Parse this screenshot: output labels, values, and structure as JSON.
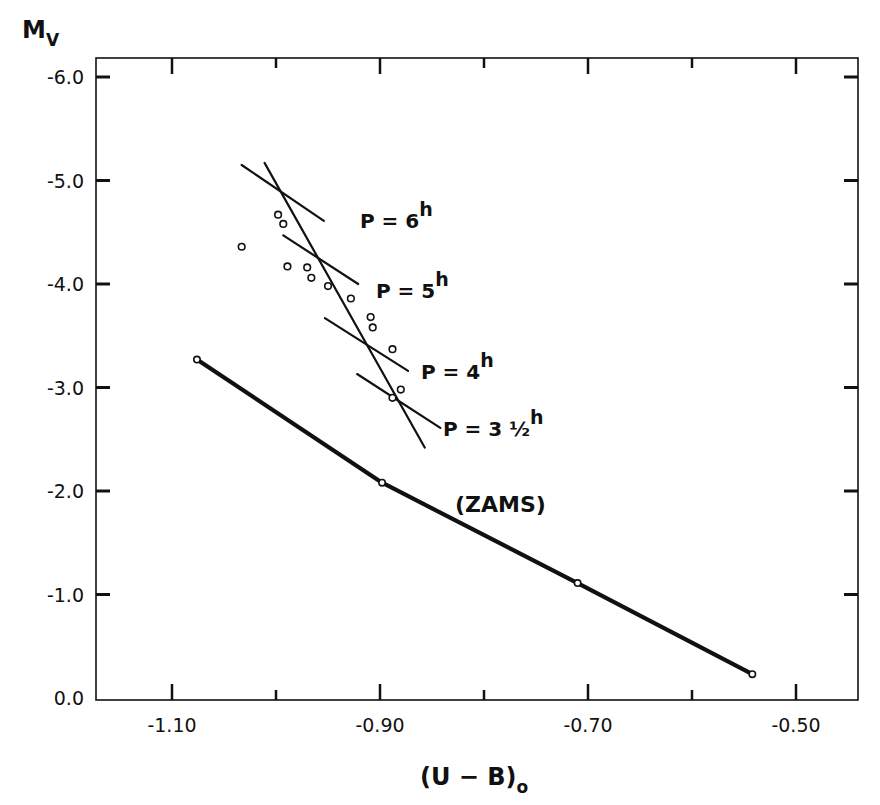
{
  "chart_data": {
    "type": "scatter",
    "title": "",
    "xlabel": "(U - B)o",
    "xlabel_main": "(U − B)",
    "xlabel_sub": "o",
    "ylabel": "Mv",
    "ylabel_main": "M",
    "ylabel_sub": "V",
    "xlim": [
      -1.175,
      -0.435
    ],
    "ylim": [
      0.0,
      -6.2
    ],
    "y_inverted": true,
    "grid": false,
    "x_ticks": [
      -1.1,
      -0.9,
      -0.7,
      -0.5
    ],
    "x_tick_labels": [
      "-1.10",
      "-0.90",
      "-0.70",
      "-0.50"
    ],
    "x_minor_ticks": [
      -1.0,
      -0.8,
      -0.6
    ],
    "y_ticks": [
      -6.0,
      -5.0,
      -4.0,
      -3.0,
      -2.0,
      -1.0,
      0.0
    ],
    "y_tick_labels": [
      "-6.0",
      "-5.0",
      "-4.0",
      "-3.0",
      "-2.0",
      "-1.0",
      "0.0"
    ],
    "series": [
      {
        "name": "ZAMS",
        "kind": "line-with-markers",
        "label": "(ZAMS)",
        "x": [
          -1.076,
          -0.898,
          -0.71,
          -0.542
        ],
        "y": [
          -3.27,
          -2.08,
          -1.11,
          -0.23
        ]
      },
      {
        "name": "Be stars",
        "kind": "scatter",
        "x": [
          -0.998,
          -0.993,
          -1.033,
          -0.989,
          -0.97,
          -0.966,
          -0.95,
          -0.928,
          -0.909,
          -0.907,
          -0.888,
          -0.88,
          -0.888
        ],
        "y": [
          -4.67,
          -4.58,
          -4.36,
          -4.17,
          -4.16,
          -4.06,
          -3.98,
          -3.86,
          -3.68,
          -3.58,
          -3.37,
          -2.98,
          -2.9
        ]
      },
      {
        "name": "Fit line",
        "kind": "line",
        "x": [
          -1.011,
          -0.857
        ],
        "y": [
          -5.17,
          -2.42
        ]
      },
      {
        "name": "P = 6h",
        "kind": "line",
        "label": "P = 6",
        "label_sup": "h",
        "x": [
          -1.033,
          -0.954
        ],
        "y": [
          -5.15,
          -4.61
        ]
      },
      {
        "name": "P = 5h",
        "kind": "line",
        "label": "P = 5",
        "label_sup": "h",
        "x": [
          -0.993,
          -0.921
        ],
        "y": [
          -4.47,
          -4.0
        ]
      },
      {
        "name": "P = 4h",
        "kind": "line",
        "label": "P = 4",
        "label_sup": "h",
        "x": [
          -0.953,
          -0.873
        ],
        "y": [
          -3.67,
          -3.16
        ]
      },
      {
        "name": "P = 3 1/2h",
        "kind": "line",
        "label": "P = 3 ½",
        "label_sup": "h",
        "x": [
          -0.922,
          -0.842
        ],
        "y": [
          -3.13,
          -2.61
        ]
      }
    ]
  },
  "colors": {
    "ink": "#111111",
    "background": "#ffffff"
  }
}
